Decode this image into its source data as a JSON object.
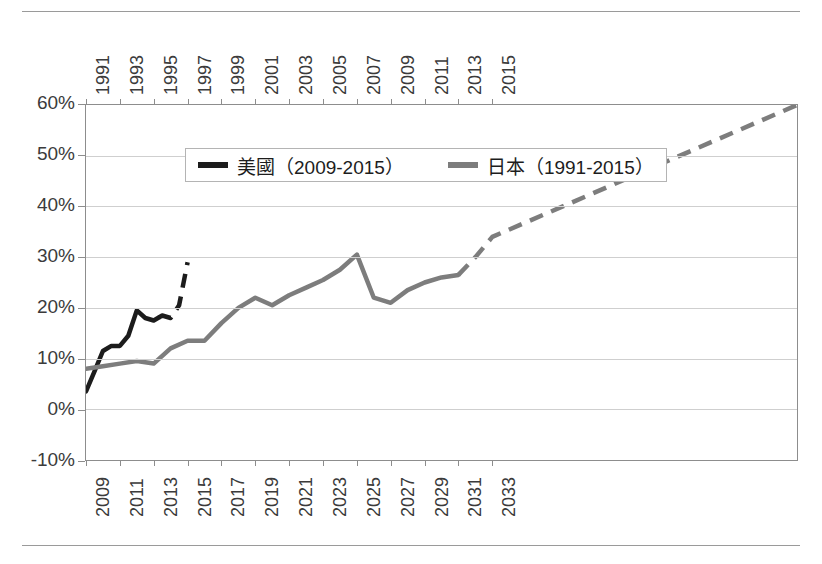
{
  "chart_data": {
    "type": "line",
    "title": "",
    "subtitle": "",
    "xlabel": "",
    "ylabel": "",
    "ylim": [
      -10,
      60
    ],
    "y_tick_labels": [
      "60%",
      "50%",
      "40%",
      "30%",
      "20%",
      "10%",
      "0%",
      "-10%"
    ],
    "y_ticks": [
      60,
      50,
      40,
      30,
      20,
      10,
      0,
      -10
    ],
    "grid": true,
    "legend_position": "top-center-inside",
    "axes": {
      "top_axis": {
        "name": "japan-year-axis",
        "range": [
          1991,
          2033
        ],
        "tick_labels": [
          "1991",
          "1993",
          "1995",
          "1997",
          "1999",
          "2001",
          "2003",
          "2005",
          "2007",
          "2009",
          "2011",
          "2013",
          "2015"
        ],
        "tick_values": [
          1991,
          1993,
          1995,
          1997,
          1999,
          2001,
          2003,
          2005,
          2007,
          2009,
          2011,
          2013,
          2015
        ]
      },
      "bottom_axis": {
        "name": "us-year-axis",
        "range": [
          2009,
          2051
        ],
        "tick_labels": [
          "2009",
          "2011",
          "2013",
          "2015",
          "2017",
          "2019",
          "2021",
          "2023",
          "2025",
          "2027",
          "2029",
          "2031",
          "2033"
        ],
        "tick_values": [
          2009,
          2011,
          2013,
          2015,
          2017,
          2019,
          2021,
          2023,
          2025,
          2027,
          2029,
          2031,
          2033
        ]
      }
    },
    "series": [
      {
        "name": "美國（2009-2015）",
        "short_name": "US",
        "color": "#1c1c1c",
        "axis": "bottom",
        "x": [
          2009,
          2009.5,
          2010,
          2010.5,
          2011,
          2011.5,
          2012,
          2012.5,
          2013,
          2013.5,
          2014,
          2014.5,
          2015
        ],
        "values": [
          3.5,
          7.5,
          11.5,
          12.5,
          12.5,
          14.5,
          19.5,
          18.0,
          17.5,
          18.5,
          18.0,
          20.5,
          29.0
        ],
        "solid_until_x": 2013.3,
        "dashed_from_x": 2013.3,
        "dashed_note": "projection"
      },
      {
        "name": "日本（1991-2015）",
        "short_name": "Japan",
        "color": "#7d7d7d",
        "axis": "top",
        "x": [
          1991,
          1992,
          1993,
          1994,
          1995,
          1996,
          1997,
          1998,
          1999,
          2000,
          2001,
          2002,
          2003,
          2004,
          2005,
          2006,
          2007,
          2008,
          2009,
          2010,
          2011,
          2012,
          2013,
          2014,
          2015
        ],
        "values": [
          8.0,
          8.5,
          9.0,
          9.5,
          9.0,
          12.0,
          13.5,
          13.5,
          17.0,
          20.0,
          22.0,
          20.5,
          22.5,
          24.0,
          25.5,
          27.5,
          30.5,
          22.0,
          21.0,
          23.5,
          25.0,
          26.0,
          26.5,
          30.0,
          34.0
        ],
        "solid_until_x": 2013.0,
        "dashed_from_x": 2013.0,
        "dashed_end_value": 60.0,
        "dashed_note": "projection"
      }
    ],
    "legend": [
      {
        "label": "美國（2009-2015）",
        "color": "#1c1c1c"
      },
      {
        "label": "日本（1991-2015）",
        "color": "#7d7d7d"
      }
    ]
  }
}
